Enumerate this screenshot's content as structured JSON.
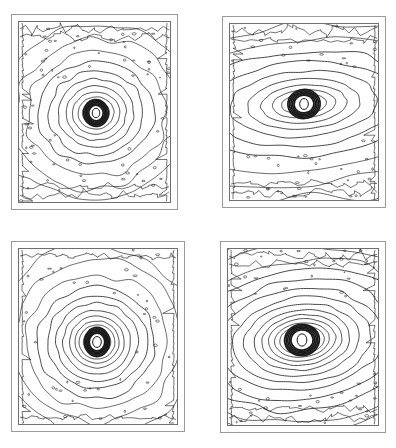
{
  "figure": {
    "title": "",
    "caption": "",
    "background_color": "#ffffff",
    "line_color": "#1a1a1a",
    "frame_color": "#777777",
    "width": 396,
    "height": 448,
    "panel_count": 4,
    "layout": "2x2 grid"
  },
  "chart_data": {
    "type": "contour",
    "title": "",
    "subtitle": "",
    "xlabel": "",
    "ylabel": "",
    "grid": false,
    "legend_position": "none",
    "panels": [
      {
        "id": "panel-top-left",
        "label": "",
        "position": "top-left",
        "frame": {
          "x": 11,
          "y": 14,
          "width": 167,
          "height": 196
        },
        "plot_area": {
          "x": 18,
          "y": 22,
          "width": 152,
          "height": 180
        },
        "center": {
          "x": 96,
          "y": 113
        },
        "core_radius": 7,
        "axis_ratio": 1.12,
        "position_angle_deg": -5,
        "contour_count": 11,
        "contour_levels": [
          1,
          2,
          3,
          4,
          5,
          6,
          7,
          8,
          9,
          10,
          11
        ],
        "contour_radii": [
          9,
          12,
          16,
          21,
          27,
          34,
          42,
          51,
          62,
          74,
          88
        ],
        "noise_amplitude": 0.035,
        "shape": "near-circular",
        "edge_noise": "high"
      },
      {
        "id": "panel-top-right",
        "label": "",
        "position": "top-right",
        "frame": {
          "x": 222,
          "y": 16,
          "width": 164,
          "height": 192
        },
        "plot_area": {
          "x": 229,
          "y": 24,
          "width": 150,
          "height": 176
        },
        "center": {
          "x": 304,
          "y": 104
        },
        "core_radius": 8,
        "axis_ratio": 2.25,
        "position_angle_deg": -4,
        "contour_count": 10,
        "contour_levels": [
          1,
          2,
          3,
          4,
          5,
          6,
          7,
          8,
          9,
          10
        ],
        "contour_radii": [
          10,
          14,
          19,
          25,
          33,
          42,
          53,
          66,
          80,
          96
        ],
        "noise_amplitude": 0.04,
        "shape": "strongly-elongated-horizontal",
        "edge_noise": "high"
      },
      {
        "id": "panel-bottom-left",
        "label": "",
        "position": "bottom-left",
        "frame": {
          "x": 11,
          "y": 241,
          "width": 174,
          "height": 191
        },
        "plot_area": {
          "x": 19,
          "y": 249,
          "width": 158,
          "height": 175
        },
        "center": {
          "x": 97,
          "y": 342
        },
        "core_radius": 8,
        "axis_ratio": 1.05,
        "position_angle_deg": 0,
        "contour_count": 12,
        "contour_levels": [
          1,
          2,
          3,
          4,
          5,
          6,
          7,
          8,
          9,
          10,
          11,
          12
        ],
        "contour_radii": [
          10,
          13,
          17,
          21,
          26,
          32,
          39,
          47,
          56,
          67,
          80,
          95
        ],
        "noise_amplitude": 0.028,
        "shape": "circular",
        "edge_noise": "moderate"
      },
      {
        "id": "panel-bottom-right",
        "label": "",
        "position": "bottom-right",
        "frame": {
          "x": 220,
          "y": 241,
          "width": 166,
          "height": 192
        },
        "plot_area": {
          "x": 227,
          "y": 249,
          "width": 152,
          "height": 176
        },
        "center": {
          "x": 302,
          "y": 340
        },
        "core_radius": 9,
        "axis_ratio": 1.6,
        "position_angle_deg": -6,
        "contour_count": 15,
        "contour_levels": [
          1,
          2,
          3,
          4,
          5,
          6,
          7,
          8,
          9,
          10,
          11,
          12,
          13,
          14,
          15
        ],
        "contour_radii": [
          11,
          14,
          17,
          21,
          25,
          30,
          36,
          43,
          51,
          60,
          70,
          81,
          93,
          106,
          120
        ],
        "noise_amplitude": 0.035,
        "shape": "elongated-horizontal",
        "edge_noise": "high"
      }
    ]
  }
}
